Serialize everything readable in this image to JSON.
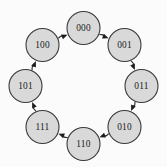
{
  "figure": {
    "kind": "directed-cycle-graph",
    "title": "",
    "background_color": "#fbfbfb",
    "node_fill_color": "#d9d9d9",
    "node_stroke_color": "#3a3a3a",
    "edge_color": "#2b2b2b",
    "label_color": "#1a1a1a",
    "layout": "circular",
    "center": {
      "x": 83.5,
      "y": 86
    },
    "radius": 58,
    "node_radius": 16.5
  },
  "nodes": [
    {
      "id": "n000",
      "label": "000",
      "angle_deg": -90,
      "cx": 83.5,
      "cy": 28.0
    },
    {
      "id": "n001",
      "label": "001",
      "angle_deg": -45,
      "cx": 124.5,
      "cy": 45.0
    },
    {
      "id": "n011",
      "label": "011",
      "angle_deg": 0,
      "cx": 141.5,
      "cy": 86.0
    },
    {
      "id": "n010",
      "label": "010",
      "angle_deg": 45,
      "cx": 124.5,
      "cy": 127.0
    },
    {
      "id": "n110",
      "label": "110",
      "angle_deg": 90,
      "cx": 83.5,
      "cy": 144.0
    },
    {
      "id": "n111",
      "label": "111",
      "angle_deg": 135,
      "cx": 42.5,
      "cy": 127.0
    },
    {
      "id": "n101",
      "label": "101",
      "angle_deg": 180,
      "cx": 25.5,
      "cy": 86.0
    },
    {
      "id": "n100",
      "label": "100",
      "angle_deg": -135,
      "cx": 42.5,
      "cy": 45.0
    }
  ],
  "edges": [
    {
      "from": "n000",
      "to": "n001",
      "directed": true
    },
    {
      "from": "n001",
      "to": "n011",
      "directed": true
    },
    {
      "from": "n011",
      "to": "n010",
      "directed": true
    },
    {
      "from": "n010",
      "to": "n110",
      "directed": true
    },
    {
      "from": "n110",
      "to": "n111",
      "directed": true
    },
    {
      "from": "n111",
      "to": "n101",
      "directed": true
    },
    {
      "from": "n101",
      "to": "n100",
      "directed": true
    },
    {
      "from": "n100",
      "to": "n000",
      "directed": true
    }
  ],
  "chart_data": {
    "type": "diagram",
    "title": "",
    "categories": [
      "000",
      "001",
      "011",
      "010",
      "110",
      "111",
      "101",
      "100"
    ],
    "sequence": [
      "000",
      "001",
      "011",
      "010",
      "110",
      "111",
      "101",
      "100",
      "000"
    ],
    "node_count": 8,
    "edge_count": 8
  }
}
